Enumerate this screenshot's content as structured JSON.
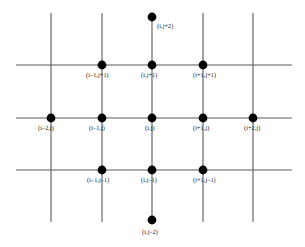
{
  "figure": {
    "type": "lattice-stencil-diagram",
    "width": 305,
    "height": 247,
    "background_color": "#ffffff",
    "line_color": "#5a5a5a",
    "node_color": "#000000",
    "label_color": "#141414",
    "node_radius": 4.4,
    "line_width": 1.1
  },
  "grid": {
    "vertical_lines": [
      {
        "name": "column-i-minus-2",
        "x": 51,
        "y1": 13,
        "y2": 222
      },
      {
        "name": "column-i-minus-1",
        "x": 102,
        "y1": 13,
        "y2": 222
      },
      {
        "name": "column-i",
        "x": 152,
        "y1": 17,
        "y2": 220
      },
      {
        "name": "column-i-plus-1",
        "x": 203,
        "y1": 13,
        "y2": 222
      },
      {
        "name": "column-i-plus-2",
        "x": 253,
        "y1": 13,
        "y2": 222
      }
    ],
    "horizontal_lines": [
      {
        "name": "row-j-plus-1",
        "y": 65,
        "x1": 16,
        "x2": 292
      },
      {
        "name": "row-j",
        "y": 118,
        "x1": 16,
        "x2": 292
      },
      {
        "name": "row-j-minus-1",
        "y": 170,
        "x1": 16,
        "x2": 292
      }
    ]
  },
  "nodes": [
    {
      "id": "i-jp2",
      "label": "(i,j+2)",
      "x": 152,
      "y": 17,
      "label_x": 157,
      "label_y": 22
    },
    {
      "id": "im1-jp1",
      "label": "(i–1,j+1)",
      "x": 102,
      "y": 65,
      "label_x": 86,
      "label_y": 71
    },
    {
      "id": "i-jp1",
      "label": "(i,j+1)",
      "x": 152,
      "y": 65,
      "label_x": 141,
      "label_y": 71
    },
    {
      "id": "ip1-jp1",
      "label": "(i+1,j+1)",
      "x": 203,
      "y": 65,
      "label_x": 193,
      "label_y": 71
    },
    {
      "id": "im2-j",
      "label": "(i–2,j)",
      "x": 51,
      "y": 118,
      "label_x": 38,
      "label_y": 124
    },
    {
      "id": "im1-j",
      "label": "(i–1,j)",
      "x": 102,
      "y": 118,
      "label_x": 89,
      "label_y": 124
    },
    {
      "id": "i-j",
      "label": "(i,j)",
      "x": 152,
      "y": 118,
      "label_x": 145,
      "label_y": 124
    },
    {
      "id": "ip1-j",
      "label": "(i+1,j)",
      "x": 203,
      "y": 118,
      "label_x": 193,
      "label_y": 124
    },
    {
      "id": "ip2-j",
      "label": "(i+2,j)",
      "x": 253,
      "y": 118,
      "label_x": 244,
      "label_y": 124
    },
    {
      "id": "im1-jm1",
      "label": "(i–1,j–1)",
      "x": 102,
      "y": 170,
      "label_x": 87,
      "label_y": 176
    },
    {
      "id": "i-jm1",
      "label": "(i,j–1)",
      "x": 152,
      "y": 170,
      "label_x": 141,
      "label_y": 176
    },
    {
      "id": "ip1-jm1",
      "label": "(i+1,j–1)",
      "x": 203,
      "y": 170,
      "label_x": 193,
      "label_y": 176
    },
    {
      "id": "i-jm2",
      "label": "(i,j–2)",
      "x": 152,
      "y": 220,
      "label_x": 142,
      "label_y": 228
    }
  ],
  "chart_data": {
    "type": "scatter",
    "title": "",
    "xlabel": "",
    "ylabel": "",
    "grid": true,
    "legend": null,
    "x": [
      0,
      -1,
      0,
      1,
      -2,
      -1,
      0,
      1,
      2,
      -1,
      0,
      1,
      0
    ],
    "y": [
      2,
      1,
      1,
      1,
      0,
      0,
      0,
      0,
      0,
      -1,
      -1,
      -1,
      -2
    ],
    "point_labels": [
      "(i,j+2)",
      "(i–1,j+1)",
      "(i,j+1)",
      "(i+1,j+1)",
      "(i–2,j)",
      "(i–1,j)",
      "(i,j)",
      "(i+1,j)",
      "(i+2,j)",
      "(i–1,j–1)",
      "(i,j–1)",
      "(i+1,j–1)",
      "(i,j–2)"
    ],
    "xlim": [
      -2.6,
      2.6
    ],
    "ylim": [
      -2.4,
      2.4
    ]
  }
}
